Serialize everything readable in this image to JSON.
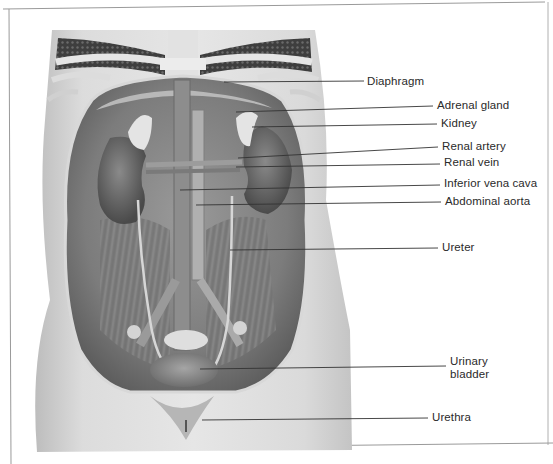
{
  "figure": {
    "background": "#ffffff",
    "line_color": "#333333",
    "frame_color": "#8a8a8a",
    "illustration": {
      "subject": "female urinary system, anterior view of abdomen and pelvis",
      "palette": [
        "#e9e9e9",
        "#cfcfcf",
        "#a8a8a8",
        "#7d7d7d",
        "#555555",
        "#3a3a3a"
      ]
    },
    "labels": [
      {
        "id": "diaphragm",
        "text": "Diaphragm",
        "x": 367,
        "y": 75,
        "line": [
          224,
          82,
          364,
          81
        ]
      },
      {
        "id": "adrenal-gland",
        "text": "Adrenal gland",
        "x": 437,
        "y": 99,
        "line": [
          236,
          112,
          433,
          106
        ]
      },
      {
        "id": "kidney",
        "text": "Kidney",
        "x": 441,
        "y": 117,
        "line": [
          252,
          127,
          437,
          124
        ]
      },
      {
        "id": "renal-artery",
        "text": "Renal artery",
        "x": 442,
        "y": 140,
        "line": [
          238,
          158,
          438,
          147
        ]
      },
      {
        "id": "renal-vein",
        "text": "Renal vein",
        "x": 444,
        "y": 156,
        "line": [
          236,
          167,
          440,
          164
        ]
      },
      {
        "id": "inferior-vena-cava",
        "text": "Inferior vena cava",
        "x": 444,
        "y": 177,
        "line": [
          180,
          190,
          440,
          185
        ]
      },
      {
        "id": "abdominal-aorta",
        "text": "Abdominal aorta",
        "x": 445,
        "y": 195,
        "line": [
          196,
          205,
          441,
          202
        ]
      },
      {
        "id": "ureter",
        "text": "Ureter",
        "x": 442,
        "y": 241,
        "line": [
          230,
          250,
          438,
          248
        ]
      },
      {
        "id": "urinary-bladder",
        "text": "Urinary bladder",
        "x": 450,
        "y": 355,
        "line": [
          200,
          369,
          446,
          366
        ]
      },
      {
        "id": "urethra",
        "text": "Urethra",
        "x": 432,
        "y": 411,
        "line": [
          202,
          420,
          428,
          418
        ]
      }
    ]
  }
}
